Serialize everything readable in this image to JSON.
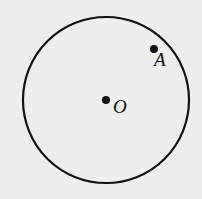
{
  "diagram": {
    "circle": {
      "cx": 106,
      "cy": 100,
      "r": 83,
      "stroke": "#111111"
    },
    "points": [
      {
        "name": "O",
        "x": 106,
        "y": 100,
        "label_x": 113,
        "label_y": 113
      },
      {
        "name": "A",
        "x": 154,
        "y": 49,
        "label_x": 154,
        "label_y": 66
      }
    ]
  }
}
